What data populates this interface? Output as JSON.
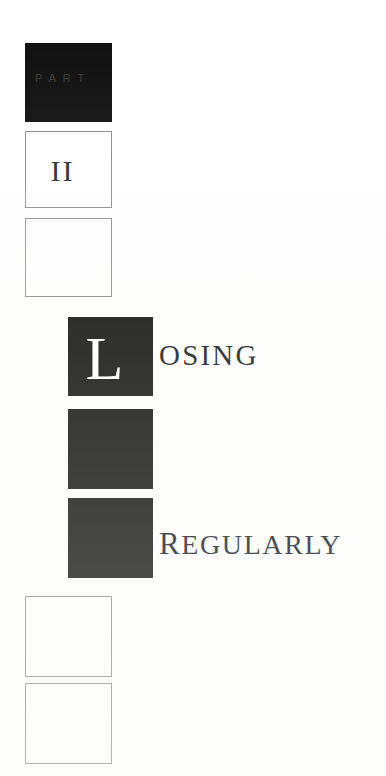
{
  "page": {
    "kind": "book-part-title-page",
    "background_color": "#ffffff",
    "ink_color": "#16181a",
    "plate_color": "#0d0d0d",
    "outline_color": "#8e8e8e"
  },
  "part_heading": {
    "label": "PART",
    "label_color": "#3b3b3b",
    "numeral": "II"
  },
  "title": {
    "dropcap": "L",
    "line_one_rest": "OSING",
    "line_two_lead": "R",
    "line_two_rest": "EGULARLY",
    "full_text": "LOSING REGULARLY"
  },
  "plates": [
    {
      "name": "part-plate",
      "style": "black",
      "x": 25,
      "y": 43,
      "w": 87,
      "h": 79
    },
    {
      "name": "numeral-plate",
      "style": "outline",
      "x": 25,
      "y": 131,
      "w": 87,
      "h": 77
    },
    {
      "name": "spacer-plate-upper",
      "style": "outline",
      "x": 25,
      "y": 218,
      "w": 87,
      "h": 79
    },
    {
      "name": "dropcap-plate",
      "style": "black",
      "x": 68,
      "y": 317,
      "w": 85,
      "h": 79
    },
    {
      "name": "middle-plate",
      "style": "black",
      "x": 68,
      "y": 409,
      "w": 85,
      "h": 80
    },
    {
      "name": "lower-plate",
      "style": "black",
      "x": 68,
      "y": 498,
      "w": 85,
      "h": 80
    },
    {
      "name": "spacer-plate-lower-1",
      "style": "outline",
      "x": 25,
      "y": 596,
      "w": 87,
      "h": 81
    },
    {
      "name": "spacer-plate-lower-2",
      "style": "outline",
      "x": 25,
      "y": 683,
      "w": 87,
      "h": 81
    }
  ]
}
